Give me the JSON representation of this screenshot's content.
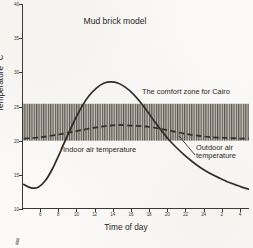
{
  "chart_data": {
    "type": "line",
    "title": "Mud brick model",
    "xlabel": "Time of day",
    "ylabel": "Temperature °C",
    "xlim": [
      4,
      29
    ],
    "ylim": [
      10,
      40
    ],
    "grid": false,
    "legend_position": "inline-annotations",
    "y_ticks": [
      10,
      15,
      20,
      25,
      30,
      35,
      40
    ],
    "y_tick_labels": [
      "10",
      "15",
      "20",
      "25",
      "30",
      "35",
      "40"
    ],
    "x_ticks": [
      6,
      8,
      10,
      12,
      14,
      16,
      18,
      20,
      22,
      24,
      26,
      28
    ],
    "x_tick_labels": [
      "6",
      "8",
      "10",
      "12",
      "14",
      "16",
      "18",
      "20",
      "22",
      "24",
      "2",
      "4"
    ],
    "bands": [
      {
        "name": "The comfort zone for Cairo",
        "y_min": 20.0,
        "y_max": 25.4,
        "hatch": "vertical-lines",
        "fill": "#b9b5ad"
      }
    ],
    "series": [
      {
        "name": "Outdoor air temperature",
        "style": "solid",
        "color": "#2e2b27",
        "x": [
          4.2,
          5.0,
          5.8,
          6.6,
          7.4,
          8.2,
          9.0,
          9.8,
          10.6,
          11.4,
          12.2,
          13.0,
          13.8,
          14.6,
          15.4,
          16.2,
          17.0,
          17.8,
          18.6,
          19.4,
          20.2,
          21.0,
          21.8,
          22.6,
          23.4,
          24.2,
          25.0,
          25.8,
          26.6,
          27.4,
          28.2,
          29.0
        ],
        "y": [
          13.6,
          13.1,
          13.2,
          14.2,
          16.0,
          18.3,
          20.7,
          23.0,
          25.0,
          26.6,
          27.7,
          28.4,
          28.6,
          28.4,
          27.8,
          26.9,
          25.7,
          24.3,
          22.8,
          21.4,
          20.1,
          19.0,
          18.0,
          17.1,
          16.3,
          15.6,
          15.0,
          14.5,
          14.0,
          13.6,
          13.2,
          12.9
        ]
      },
      {
        "name": "Indoor air temperature",
        "style": "dashed",
        "color": "#2e2b27",
        "x": [
          4.2,
          6.0,
          8.0,
          10.0,
          11.5,
          13.0,
          14.5,
          16.0,
          17.5,
          19.0,
          20.5,
          22.0,
          23.5,
          25.0,
          26.5,
          28.0,
          29.0
        ],
        "y": [
          20.3,
          20.5,
          20.9,
          21.4,
          21.8,
          22.1,
          22.3,
          22.2,
          22.1,
          21.8,
          21.4,
          21.0,
          20.7,
          20.5,
          20.4,
          20.3,
          20.3
        ]
      }
    ],
    "annotations": [
      {
        "name": "comfort-zone-label",
        "text": "The comfort zone for Cairo"
      },
      {
        "name": "indoor-label",
        "text": "Indoor air temperature",
        "points_to": "indoor-curve"
      },
      {
        "name": "outdoor-label",
        "text": "Outdoor air temperature",
        "line1": "Outdoor air",
        "line2": "temperature",
        "points_to": "outdoor-curve"
      }
    ]
  }
}
